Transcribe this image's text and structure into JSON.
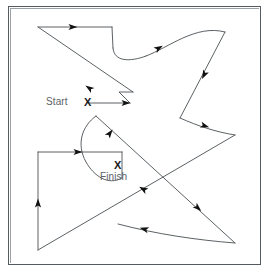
{
  "figure": {
    "type": "maze-path-diagram",
    "background_color": "#ffffff",
    "border_color": "#555c60",
    "stroke_color": "#4a4f52",
    "arrow_color": "#111111",
    "label_color": "#5c6266",
    "markers": [
      {
        "name": "start",
        "label": "Start",
        "glyph": "X",
        "label_x": 46,
        "label_y": 96,
        "marker_x": 88,
        "marker_y": 103
      },
      {
        "name": "finish",
        "label": "Finish",
        "glyph": "X",
        "label_x": 100,
        "label_y": 171,
        "marker_x": 118,
        "marker_y": 166
      }
    ],
    "path": {
      "description": "Continuous directed route from Start marker through the enclosure to the Finish marker",
      "segments": [
        "M 88 103 L 130 103",
        "M 130 103 L 119 92 L 133 92",
        "M 133 92 L 38 27",
        "M 38 27 L 112 27",
        "M 112 27 L 113 48",
        "M 113 48 C 114 62 130 62 146 56",
        "M 146 56 C 168 48 196 24 225 32",
        "M 225 32 L 180 118",
        "M 180 118 C 198 126 216 132 235 135",
        "M 235 135 L 38 250",
        "M 38 250 L 38 152",
        "M 38 152 L 122 152",
        "M 122 152 L 122 178",
        "M 122 178 C 108 186 94 176 86 162 C 76 144 82 126 96 116",
        "M 96 116 L 235 243",
        "M 235 243 C 196 240 156 234 118 224"
      ],
      "arrows": [
        {
          "name": "arrow-start-right",
          "x": 126,
          "y": 103,
          "angle": 0
        },
        {
          "name": "arrow-top-right",
          "x": 73,
          "y": 27,
          "angle": 0
        },
        {
          "name": "arrow-diagonal-down-left",
          "x": 89,
          "y": 88,
          "angle": 214
        },
        {
          "name": "arrow-ucurve-up-right",
          "x": 159,
          "y": 48,
          "angle": 330
        },
        {
          "name": "arrow-right-down-left",
          "x": 204,
          "y": 75,
          "angle": 117
        },
        {
          "name": "arrow-valley-right",
          "x": 205,
          "y": 126,
          "angle": 18
        },
        {
          "name": "arrow-long-diagonal-down-left",
          "x": 143,
          "y": 189,
          "angle": 210
        },
        {
          "name": "arrow-vertical-up",
          "x": 38,
          "y": 203,
          "angle": 270
        },
        {
          "name": "arrow-rect-top-right",
          "x": 78,
          "y": 152,
          "angle": 0
        },
        {
          "name": "arrow-curve-up-right",
          "x": 110,
          "y": 133,
          "angle": 307
        },
        {
          "name": "arrow-diagonal-down-right",
          "x": 198,
          "y": 208,
          "angle": 42
        },
        {
          "name": "arrow-bottom-curve-left",
          "x": 144,
          "y": 229,
          "angle": 196
        }
      ]
    }
  }
}
